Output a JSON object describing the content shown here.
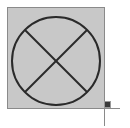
{
  "diagram": {
    "shape": "circle-with-x",
    "symbol_name": "crossed-circle",
    "colors": {
      "background": "#ffffff",
      "box_fill": "#c8c8c8",
      "box_border": "#8a8a8a",
      "stroke": "#2a2a2a",
      "handle_fill": "#3a3a3a",
      "handle_border": "#9a9a9a",
      "guide_line": "#8a8a8a"
    },
    "box": {
      "x": 7,
      "y": 7,
      "width": 97,
      "height": 101
    },
    "circle": {
      "cx": 56,
      "cy": 61,
      "r": 44
    },
    "resize_handle": {
      "x": 104,
      "y": 101,
      "size": 6
    }
  }
}
